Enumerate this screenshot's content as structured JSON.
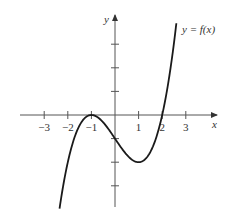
{
  "chart_data": {
    "type": "line",
    "title": "",
    "function_label": "y = f(x)",
    "xlabel": "x",
    "ylabel": "y",
    "x_ticks": [
      -3,
      -2,
      -1,
      1,
      2,
      3
    ],
    "x_tick_labels": [
      "−3",
      "−2",
      "−1",
      "1",
      "2",
      "3"
    ],
    "y_ticks": [
      -3,
      -2,
      -1,
      1,
      2,
      3
    ],
    "y_tick_labels": [],
    "xlim": [
      -4,
      4.3
    ],
    "ylim": [
      -3.9,
      4.3
    ],
    "grid": false,
    "series": [
      {
        "name": "f(x)",
        "formula": "(x^3 - 3x - 2)/2",
        "x": [
          -2.35,
          -2,
          -1.5,
          -1,
          -0.5,
          0,
          0.5,
          1,
          1.5,
          2,
          2.3,
          2.6
        ],
        "values": [
          -3.96,
          -2,
          -0.44,
          0,
          -0.31,
          -1,
          -1.69,
          -2,
          -1.56,
          0,
          1.63,
          3.89
        ]
      }
    ],
    "annotations": [
      {
        "text": "local max at (-1, 0)"
      },
      {
        "text": "local min at (1, -2)"
      }
    ]
  },
  "colors": {
    "curve": "#1a1a1a",
    "axis": "#555555",
    "text": "#333333"
  }
}
